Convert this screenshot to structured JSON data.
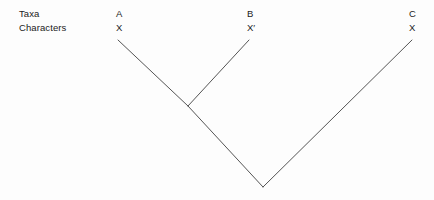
{
  "diagram": {
    "type": "phylogenetic-tree",
    "row_labels": {
      "taxa": "Taxa",
      "characters": "Characters"
    },
    "columns": [
      {
        "taxon": "A",
        "character": "X",
        "tip_x": 118,
        "tip_y": 40
      },
      {
        "taxon": "B",
        "character": "X′",
        "tip_x": 249,
        "tip_y": 40
      },
      {
        "taxon": "C",
        "character": "X",
        "tip_x": 412,
        "tip_y": 40
      }
    ],
    "nodes": [
      {
        "name": "node-AB",
        "x": 188,
        "y": 106
      },
      {
        "name": "node-root",
        "x": 263,
        "y": 187
      }
    ],
    "branches": [
      {
        "name": "branch-A",
        "x1": 118,
        "y1": 40,
        "x2": 188,
        "y2": 106
      },
      {
        "name": "branch-B",
        "x1": 249,
        "y1": 40,
        "x2": 188,
        "y2": 106
      },
      {
        "name": "branch-AB-root",
        "x1": 188,
        "y1": 106,
        "x2": 263,
        "y2": 187
      },
      {
        "name": "branch-C",
        "x1": 412,
        "y1": 40,
        "x2": 263,
        "y2": 187
      }
    ],
    "line_color": "#555555",
    "line_width": 1,
    "background_color": "#fdfdfd"
  }
}
